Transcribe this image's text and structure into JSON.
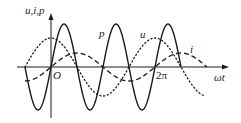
{
  "diagram": {
    "type": "ac-waveforms",
    "labels": {
      "y_axis": "u,i,p",
      "x_axis": "ωt",
      "origin": "O",
      "two_pi": "2π",
      "p_curve": "p",
      "u_curve": "u",
      "i_curve": "i"
    },
    "colors": {
      "stroke": "#1a1a1a",
      "background": "#ffffff"
    },
    "geometry": {
      "origin_x": 51,
      "axis_y": 67,
      "period_px": 104,
      "x_axis_start": 17,
      "x_axis_end": 229,
      "y_axis_top": 13,
      "y_axis_bottom": 118
    },
    "curves": [
      {
        "name": "p",
        "style": "solid",
        "formula": "P·sin(2ωt)",
        "amplitude_px": 43,
        "harmonic": 2,
        "phase": 0,
        "fn": "sin",
        "theta_start": -1.5708,
        "theta_end": 7.854
      },
      {
        "name": "u",
        "style": "dotted",
        "formula": "U·cos(ωt)",
        "amplitude_px": 29,
        "harmonic": 1,
        "phase": 0,
        "fn": "cos",
        "theta_start": -1.5708,
        "theta_end": 9.25
      },
      {
        "name": "i",
        "style": "dashed",
        "formula": "I·sin(ωt)",
        "amplitude_px": 14,
        "harmonic": 1,
        "phase": 0,
        "fn": "sin",
        "theta_start": -1.5708,
        "theta_end": 9.42
      }
    ]
  },
  "chart_data": {
    "type": "line",
    "title": "",
    "xlabel": "ωt",
    "ylabel": "u,i,p",
    "x_ticks": [
      "O",
      "2π"
    ],
    "legend": [
      "p",
      "u",
      "i"
    ],
    "grid": false,
    "series": [
      {
        "name": "u",
        "style": "dotted",
        "relative_amplitude": 1.0,
        "expression": "cos(ωt)"
      },
      {
        "name": "i",
        "style": "dashed",
        "relative_amplitude": 0.48,
        "expression": "sin(ωt)"
      },
      {
        "name": "p",
        "style": "solid",
        "relative_amplitude": 1.48,
        "expression": "sin(2ωt)"
      }
    ],
    "x_range": [
      "-π/2",
      "5π/2"
    ]
  }
}
